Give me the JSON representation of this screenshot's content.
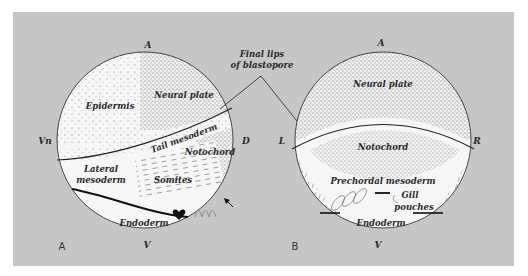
{
  "figure": {
    "annotation": "Final lips\nof blastopore",
    "annotation_line1": "Final lips",
    "annotation_line2": "of blastopore",
    "colors": {
      "background": "#c6c6c6",
      "circle_fill": "#f4f4f4",
      "stipple": "#555555",
      "line": "#222222"
    }
  },
  "panel_a": {
    "panel_label": "A",
    "axis_labels": {
      "top": "A",
      "bottom": "V",
      "left": "Vn",
      "right": "D"
    },
    "regions": {
      "epidermis": "Epidermis",
      "neural_plate": "Neural plate",
      "tail_mesoderm": "Tail mesoderm",
      "notochord": "Notochord",
      "lateral_mesoderm_1": "Lateral",
      "lateral_mesoderm_2": "mesoderm",
      "somites": "Somites",
      "endoderm": "Endoderm"
    },
    "icons": [
      "heart-icon",
      "arrow-icon"
    ]
  },
  "panel_b": {
    "panel_label": "B",
    "axis_labels": {
      "top": "A",
      "bottom": "V",
      "left": "L",
      "right": "R"
    },
    "regions": {
      "neural_plate": "Neural plate",
      "notochord": "Notochord",
      "prechordal_mesoderm": "Prechordal mesoderm",
      "gill_pouches_1": "Gill",
      "gill_pouches_2": "pouches",
      "endoderm": "Endoderm"
    }
  }
}
